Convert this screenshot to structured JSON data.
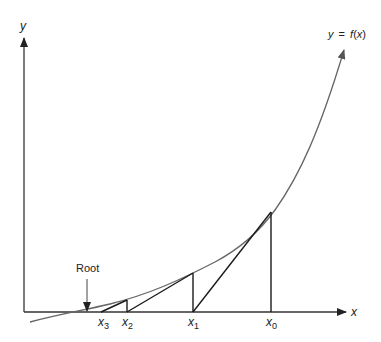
{
  "diagram": {
    "axes": {
      "x_label": "x",
      "y_label": "y"
    },
    "curve_label": {
      "y": "y",
      "eq": "=",
      "f": "f",
      "open": "(",
      "x": "x",
      "close": ")"
    },
    "root_label": "Root",
    "points": [
      {
        "name": "x",
        "sub": "0"
      },
      {
        "name": "x",
        "sub": "1"
      },
      {
        "name": "x",
        "sub": "2"
      },
      {
        "name": "x",
        "sub": "3"
      }
    ],
    "colors": {
      "curve": "#666666",
      "lines": "#1a1a1a",
      "axes": "#333333"
    }
  }
}
